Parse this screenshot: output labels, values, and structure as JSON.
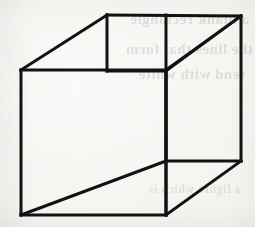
{
  "figure": {
    "name": "Necker cube",
    "alt_text": "Line drawing of a transparent wireframe cube (Necker cube) — an ambiguous figure",
    "caption": "",
    "background_color": "#f6f5f2",
    "stroke_color": "#121212",
    "stroke_width": 3,
    "width": 255,
    "height": 227
  },
  "ghost_text": {
    "description": "faint mirrored show-through text bleeding from the reverse side of the scanned page",
    "lines": [
      "a blank rectangle",
      "the lines that form",
      "tend with white",
      "a figure which is"
    ]
  },
  "geometry": {
    "front_face": {
      "name": "front-square",
      "points": "21,70 166,70 166,215 21,215"
    },
    "back_face": {
      "name": "back-square",
      "points": "107,15 241,16 241,161 166,71"
    },
    "vertices": [
      {
        "name": "front-top-left",
        "x": 21,
        "y": 70
      },
      {
        "name": "front-top-right",
        "x": 166,
        "y": 70
      },
      {
        "name": "front-bottom-right",
        "x": 166,
        "y": 215
      },
      {
        "name": "front-bottom-left",
        "x": 21,
        "y": 215
      },
      {
        "name": "back-top-left",
        "x": 107,
        "y": 15
      },
      {
        "name": "back-top-right",
        "x": 241,
        "y": 16
      },
      {
        "name": "back-bottom-right",
        "x": 241,
        "y": 161
      },
      {
        "name": "back-bottom-left",
        "x": 166,
        "y": 71
      }
    ],
    "edges": [
      {
        "name": "edge-front-top",
        "d": "M 21 70 L 166 70"
      },
      {
        "name": "edge-front-right",
        "d": "M 166 70 L 166 215"
      },
      {
        "name": "edge-front-bottom",
        "d": "M 166 215 L 21 215"
      },
      {
        "name": "edge-front-left",
        "d": "M 21 215 L 21 70"
      },
      {
        "name": "edge-back-top",
        "d": "M 107 15 L 241 16"
      },
      {
        "name": "edge-back-right",
        "d": "M 241 16 L 241 161"
      },
      {
        "name": "edge-back-bottom",
        "d": "M 241 161 L 166 161"
      },
      {
        "name": "edge-back-bottom-left-seg",
        "d": "M 166 161 L 166 71"
      },
      {
        "name": "edge-back-left",
        "d": "M 107 15 L 107 71"
      },
      {
        "name": "edge-back-left-lower",
        "d": "M 107 71 L 166 71"
      },
      {
        "name": "edge-connect-top-left",
        "d": "M 21 70 L 107 15"
      },
      {
        "name": "edge-connect-top-right",
        "d": "M 166 70 L 241 16"
      },
      {
        "name": "edge-connect-bottom-left",
        "d": "M 21 215 L 166 161"
      },
      {
        "name": "edge-connect-bottom-right",
        "d": "M 166 215 L 241 161"
      },
      {
        "name": "edge-vertical-middle",
        "d": "M 166 15 L 166 215"
      },
      {
        "name": "edge-inner-top-horizontal",
        "d": "M 166 71 L 241 16"
      }
    ]
  }
}
